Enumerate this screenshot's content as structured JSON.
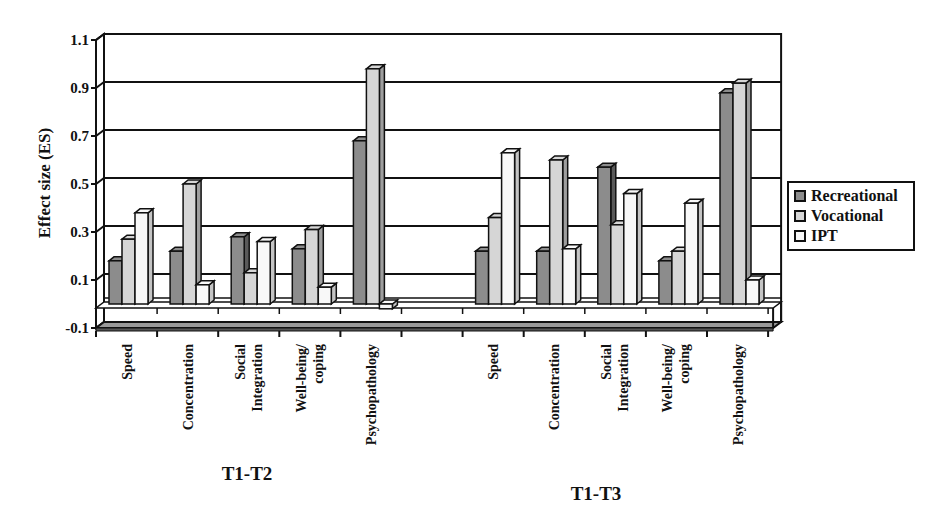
{
  "chart_data": {
    "type": "bar",
    "style": "3d-clustered-column",
    "title": "",
    "xlabel": "",
    "ylabel": "Effect size (ES)",
    "ylim": [
      -0.1,
      1.1
    ],
    "yticks": [
      "1.1",
      "0.9",
      "0.7",
      "0.5",
      "0.3",
      "0.1",
      "-0.1"
    ],
    "grid": true,
    "legend_position": "right",
    "groups": [
      {
        "label": "T1-T2",
        "categories": [
          "Speed",
          "Concentration",
          "Social Integration",
          "Well-being/ coping",
          "Psychopathology"
        ]
      },
      {
        "label": "T1-T3",
        "categories": [
          "Speed",
          "Concentration",
          "Social Integration",
          "Well-being/ coping",
          "Psychopathology"
        ]
      }
    ],
    "categories": [
      "T1-T2 Speed",
      "T1-T2 Concentration",
      "T1-T2 Social Integration",
      "T1-T2 Well-being/coping",
      "T1-T2 Psychopathology",
      "T1-T3 Speed",
      "T1-T3 Concentration",
      "T1-T3 Social Integration",
      "T1-T3 Well-being/coping",
      "T1-T3 Psychopathology"
    ],
    "series": [
      {
        "name": "Recreational",
        "color": "#8c8c8c",
        "values": [
          0.18,
          0.22,
          0.28,
          0.23,
          0.68,
          0.22,
          0.22,
          0.57,
          0.18,
          0.88
        ]
      },
      {
        "name": "Vocational",
        "color": "#d6d6d6",
        "values": [
          0.27,
          0.5,
          0.13,
          0.31,
          0.98,
          0.36,
          0.6,
          0.33,
          0.22,
          0.92
        ]
      },
      {
        "name": "IPT",
        "color": "#f8f8f8",
        "values": [
          0.38,
          0.08,
          0.26,
          0.07,
          -0.02,
          0.63,
          0.23,
          0.46,
          0.42,
          0.1
        ]
      }
    ]
  },
  "axis": {
    "title": "Effect size (ES)"
  },
  "legend": {
    "items": [
      {
        "label": "Recreational",
        "color": "#8c8c8c"
      },
      {
        "label": "Vocational",
        "color": "#d6d6d6"
      },
      {
        "label": "IPT",
        "color": "#f8f8f8"
      }
    ]
  },
  "group_labels": [
    "T1-T2",
    "T1-T3"
  ]
}
